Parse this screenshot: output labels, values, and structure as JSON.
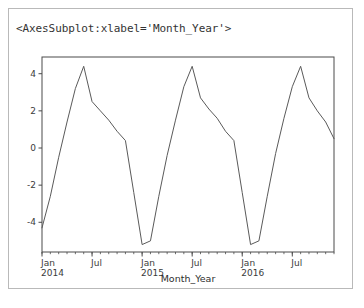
{
  "output": {
    "repr_text": "<AxesSubplot:xlabel='Month_Year'>"
  },
  "colors": {
    "line": "#5a5a5a",
    "spine": "#4a4a4a",
    "tick_text": "#3b3b3b",
    "cell_border": "#b9b9b9",
    "background": "#ffffff"
  },
  "chart_data": {
    "type": "line",
    "title": "",
    "xlabel": "Month_Year",
    "ylabel": "",
    "grid": false,
    "legend": null,
    "ylim": [
      -5.6,
      4.9
    ],
    "yticks": [
      4,
      2,
      0,
      -2,
      -4
    ],
    "ytick_labels": [
      "4",
      "2",
      "0",
      "-2",
      "-4"
    ],
    "xlim": [
      "2014-01",
      "2016-12"
    ],
    "major_xticks": [
      "2014-01",
      "2014-07",
      "2015-01",
      "2015-07",
      "2016-01",
      "2016-07"
    ],
    "xtick_labels": [
      {
        "line1": "Jan",
        "line2": "2014"
      },
      {
        "line1": "Jul",
        "line2": ""
      },
      {
        "line1": "Jan",
        "line2": "2015"
      },
      {
        "line1": "Jul",
        "line2": ""
      },
      {
        "line1": "Jan",
        "line2": "2016"
      },
      {
        "line1": "Jul",
        "line2": ""
      }
    ],
    "minor_xtick_interval": "1 month",
    "x": [
      "2014-01",
      "2014-02",
      "2014-03",
      "2014-04",
      "2014-05",
      "2014-06",
      "2014-07",
      "2014-08",
      "2014-09",
      "2014-10",
      "2014-11",
      "2014-12",
      "2015-01",
      "2015-02",
      "2015-03",
      "2015-04",
      "2015-05",
      "2015-06",
      "2015-07",
      "2015-08",
      "2015-09",
      "2015-10",
      "2015-11",
      "2015-12",
      "2016-01",
      "2016-02",
      "2016-03",
      "2016-04",
      "2016-05",
      "2016-06",
      "2016-07",
      "2016-08",
      "2016-09",
      "2016-10",
      "2016-11",
      "2016-12"
    ],
    "values": [
      -4.3,
      -2.6,
      -0.5,
      1.4,
      3.2,
      4.4,
      2.5,
      2.0,
      1.5,
      0.9,
      0.4,
      -2.4,
      -5.2,
      -5.0,
      -2.6,
      -0.4,
      1.5,
      3.3,
      4.4,
      2.7,
      2.1,
      1.6,
      0.9,
      0.4,
      -2.4,
      -5.2,
      -5.0,
      -2.6,
      -0.3,
      1.6,
      3.3,
      4.4,
      2.7,
      2.0,
      1.4,
      0.5
    ],
    "series_note": "annual sawtooth: trough near January, peak near June/July"
  }
}
